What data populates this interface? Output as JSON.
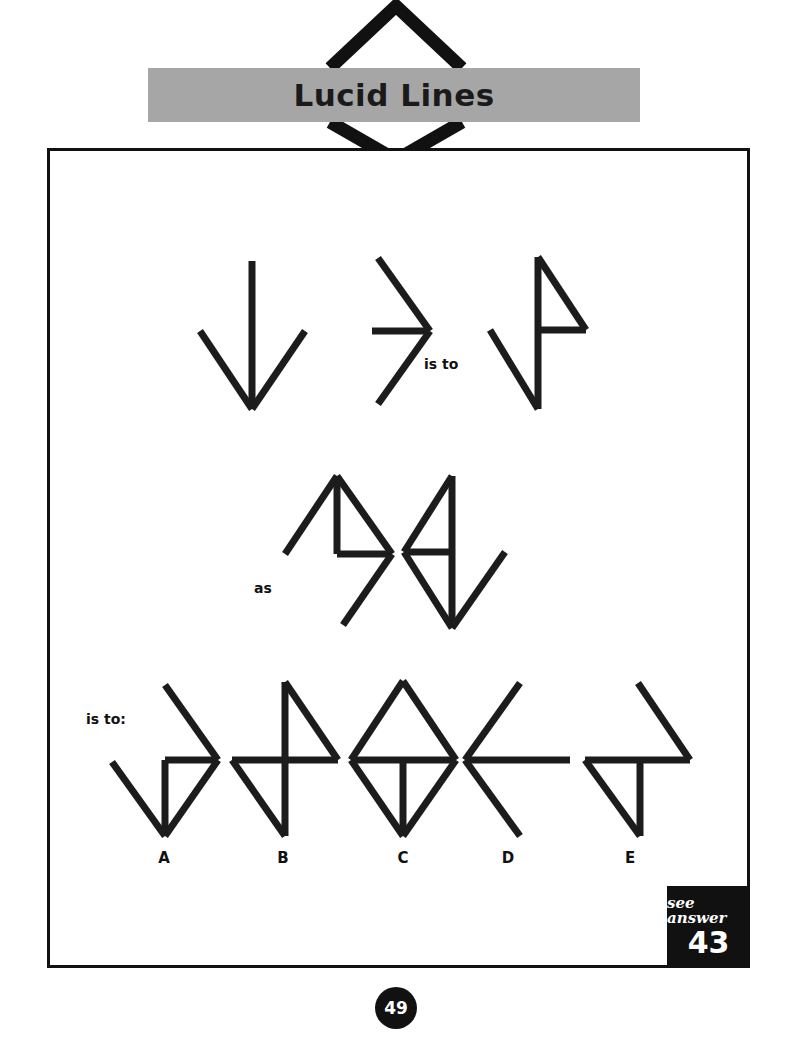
{
  "header": {
    "title": "Lucid Lines",
    "band_color": "#a6a6a6",
    "chevron_color": "#111111"
  },
  "connectors": {
    "is_to_1": "is to",
    "as": "as",
    "is_to_2": "is to:"
  },
  "options": [
    {
      "label": "A"
    },
    {
      "label": "B"
    },
    {
      "label": "C"
    },
    {
      "label": "D"
    },
    {
      "label": "E"
    }
  ],
  "answer_box": {
    "label": "see answer",
    "number": "43",
    "background": "#111111",
    "text_color": "#ffffff"
  },
  "footer": {
    "page_number": "49"
  },
  "chart_data": {
    "type": "diagram",
    "title": "Lucid Lines",
    "stroke_color": "#1c1c1c",
    "stroke_width": 7,
    "figures": [
      {
        "name": "prompt-1-down-arrow",
        "segments": [
          [
            252,
            261,
            252,
            409
          ],
          [
            200,
            331,
            252,
            409
          ],
          [
            305,
            331,
            252,
            409
          ]
        ]
      },
      {
        "name": "prompt-2-right-chevron",
        "segments": [
          [
            378,
            258,
            430,
            331
          ],
          [
            378,
            404,
            430,
            331
          ],
          [
            372,
            331,
            430,
            331
          ]
        ]
      },
      {
        "name": "prompt-3-flag",
        "segments": [
          [
            538,
            257,
            538,
            409
          ],
          [
            490,
            330,
            538,
            409
          ],
          [
            538,
            257,
            586,
            330
          ],
          [
            538,
            330,
            586,
            330
          ]
        ]
      },
      {
        "name": "prompt-4-left-triangle-arrow",
        "segments": [
          [
            337,
            476,
            337,
            554
          ],
          [
            337,
            554,
            392,
            554
          ],
          [
            337,
            476,
            392,
            554
          ],
          [
            337,
            476,
            285,
            554
          ],
          [
            392,
            554,
            343,
            625
          ]
        ]
      },
      {
        "name": "prompt-5-right-triangle-arrow",
        "segments": [
          [
            452,
            476,
            452,
            628
          ],
          [
            452,
            476,
            404,
            552
          ],
          [
            404,
            552,
            452,
            552
          ],
          [
            404,
            552,
            452,
            628
          ],
          [
            452,
            628,
            505,
            552
          ]
        ]
      },
      {
        "name": "option-A",
        "segments": [
          [
            112,
            762,
            165,
            836
          ],
          [
            165,
            760,
            165,
            836
          ],
          [
            165,
            760,
            218,
            760
          ],
          [
            165,
            685,
            218,
            760
          ],
          [
            218,
            760,
            165,
            836
          ]
        ]
      },
      {
        "name": "option-B",
        "segments": [
          [
            285,
            682,
            285,
            836
          ],
          [
            232,
            760,
            338,
            760
          ],
          [
            285,
            682,
            338,
            760
          ],
          [
            232,
            760,
            285,
            836
          ]
        ]
      },
      {
        "name": "option-C",
        "segments": [
          [
            403,
            681,
            351,
            760
          ],
          [
            403,
            681,
            456,
            760
          ],
          [
            351,
            760,
            403,
            836
          ],
          [
            456,
            760,
            403,
            836
          ],
          [
            351,
            760,
            456,
            760
          ],
          [
            403,
            760,
            403,
            836
          ]
        ]
      },
      {
        "name": "option-D",
        "segments": [
          [
            465,
            760,
            520,
            683
          ],
          [
            465,
            760,
            520,
            836
          ],
          [
            465,
            760,
            570,
            760
          ]
        ]
      },
      {
        "name": "option-E",
        "segments": [
          [
            585,
            760,
            690,
            760
          ],
          [
            638,
            683,
            690,
            760
          ],
          [
            585,
            760,
            640,
            836
          ],
          [
            640,
            760,
            640,
            836
          ]
        ]
      }
    ]
  }
}
